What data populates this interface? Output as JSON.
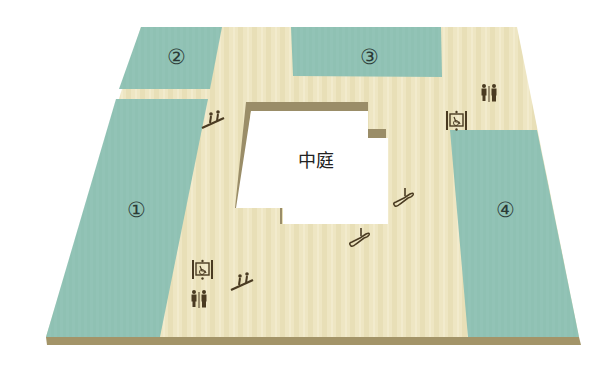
{
  "diagram": {
    "type": "floor-plan",
    "colors": {
      "corridor": "#eee6c3",
      "corridor_stripe": "#e4d9ae",
      "shop": "#8fc1b3",
      "slab_edge": "#a39468",
      "atrium": "#ffffff",
      "atrium_shadow": "#9a8d68",
      "icon": "#4a3b22"
    },
    "zones": [
      {
        "id": "1",
        "label": "①"
      },
      {
        "id": "2",
        "label": "②"
      },
      {
        "id": "3",
        "label": "③"
      },
      {
        "id": "4",
        "label": "④"
      }
    ],
    "atrium": {
      "label": "中庭"
    },
    "facilities": [
      {
        "type": "escalator",
        "location": "upper-left corridor"
      },
      {
        "type": "accessible-elevator",
        "location": "upper-right corridor"
      },
      {
        "type": "restroom",
        "location": "upper-right corridor"
      },
      {
        "type": "escalator",
        "location": "right of atrium"
      },
      {
        "type": "escalator",
        "location": "below atrium"
      },
      {
        "type": "accessible-elevator",
        "location": "lower-left corridor"
      },
      {
        "type": "restroom",
        "location": "lower-left corridor"
      },
      {
        "type": "escalator",
        "location": "lower-left corridor"
      }
    ]
  }
}
